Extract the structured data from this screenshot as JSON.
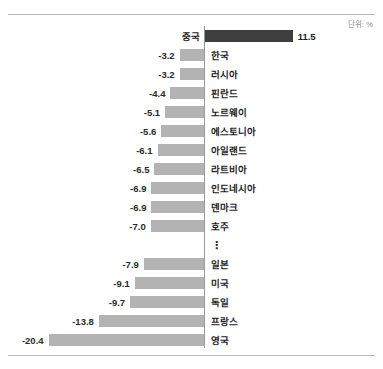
{
  "unit_caption": "단위: %",
  "colors": {
    "bar_positive": "#3f3f3f",
    "bar_negative": "#b3b3b3",
    "axis": "#9a9a9a",
    "rule": "#b9b9b9",
    "text": "#1d1d1d",
    "caption": "#8a8a8a"
  },
  "break_marker": "⋮",
  "chart_data": {
    "type": "bar",
    "orientation": "horizontal",
    "title": "",
    "subtitle": "",
    "xlabel": "",
    "ylabel": "",
    "unit": "%",
    "unit_caption": "단위: %",
    "grid": false,
    "legend": false,
    "axis_zero": 0,
    "xlim": [
      -20.4,
      11.5
    ],
    "has_axis_break": true,
    "axis_break_after_category": "호주",
    "categories": [
      "중국",
      "한국",
      "러시아",
      "핀란드",
      "노르웨이",
      "에스토니아",
      "아일랜드",
      "라트비아",
      "인도네시아",
      "덴마크",
      "호주",
      "일본",
      "미국",
      "독일",
      "프랑스",
      "영국"
    ],
    "values": [
      11.5,
      -3.2,
      -3.2,
      -4.4,
      -5.1,
      -5.6,
      -6.1,
      -6.5,
      -6.9,
      -6.9,
      -7.0,
      -7.9,
      -9.1,
      -9.7,
      -13.8,
      -20.4
    ],
    "bars": [
      {
        "category": "중국",
        "value": 11.5,
        "label": "11.5",
        "sign": "positive"
      },
      {
        "category": "한국",
        "value": -3.2,
        "label": "-3.2",
        "sign": "negative"
      },
      {
        "category": "러시아",
        "value": -3.2,
        "label": "-3.2",
        "sign": "negative"
      },
      {
        "category": "핀란드",
        "value": -4.4,
        "label": "-4.4",
        "sign": "negative"
      },
      {
        "category": "노르웨이",
        "value": -5.1,
        "label": "-5.1",
        "sign": "negative"
      },
      {
        "category": "에스토니아",
        "value": -5.6,
        "label": "-5.6",
        "sign": "negative"
      },
      {
        "category": "아일랜드",
        "value": -6.1,
        "label": "-6.1",
        "sign": "negative"
      },
      {
        "category": "라트비아",
        "value": -6.5,
        "label": "-6.5",
        "sign": "negative"
      },
      {
        "category": "인도네시아",
        "value": -6.9,
        "label": "-6.9",
        "sign": "negative"
      },
      {
        "category": "덴마크",
        "value": -6.9,
        "label": "-6.9",
        "sign": "negative"
      },
      {
        "category": "호주",
        "value": -7.0,
        "label": "-7.0",
        "sign": "negative"
      },
      {
        "category": "일본",
        "value": -7.9,
        "label": "-7.9",
        "sign": "negative"
      },
      {
        "category": "미국",
        "value": -9.1,
        "label": "-9.1",
        "sign": "negative"
      },
      {
        "category": "독일",
        "value": -9.7,
        "label": "-9.7",
        "sign": "negative"
      },
      {
        "category": "프랑스",
        "value": -13.8,
        "label": "-13.8",
        "sign": "negative"
      },
      {
        "category": "영국",
        "value": -20.4,
        "label": "-20.4",
        "sign": "negative"
      }
    ]
  }
}
